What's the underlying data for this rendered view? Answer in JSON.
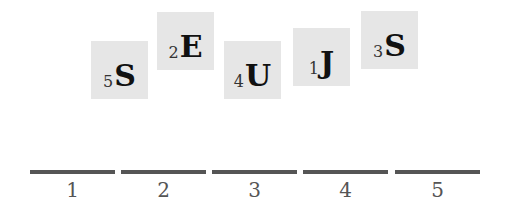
{
  "tiles": [
    {
      "letter": "S",
      "number": "5"
    },
    {
      "letter": "E",
      "number": "2"
    },
    {
      "letter": "U",
      "number": "4"
    },
    {
      "letter": "J",
      "number": "1"
    },
    {
      "letter": "S",
      "number": "3"
    }
  ],
  "slots": [
    {
      "label": "1"
    },
    {
      "label": "2"
    },
    {
      "label": "3"
    },
    {
      "label": "4"
    },
    {
      "label": "5"
    }
  ],
  "colors": {
    "tile_bg": "#e6e6e6",
    "letter": "#111111",
    "slot_line": "#555555"
  }
}
